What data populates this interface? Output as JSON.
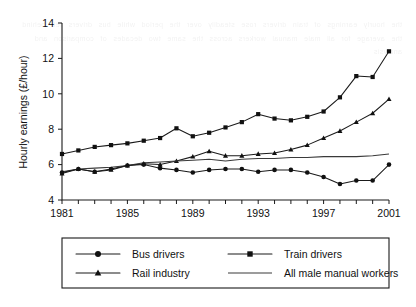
{
  "chart_data": {
    "type": "line",
    "title": "",
    "xlabel": "",
    "ylabel": "Hourly earnings (£/hour)",
    "xlim": [
      1981,
      2001
    ],
    "ylim": [
      4,
      14
    ],
    "yticks": [
      4,
      6,
      8,
      10,
      12,
      14
    ],
    "xticks": [
      1981,
      1982,
      1983,
      1984,
      1985,
      1986,
      1987,
      1988,
      1989,
      1990,
      1991,
      1992,
      1993,
      1994,
      1995,
      1996,
      1997,
      1998,
      1999,
      2000,
      2001
    ],
    "xtick_labels": [
      "1981",
      "",
      "",
      "",
      "1985",
      "",
      "",
      "",
      "1989",
      "",
      "",
      "",
      "1993",
      "",
      "",
      "",
      "1997",
      "",
      "",
      "",
      "2001"
    ],
    "grid": false,
    "legend_position": "below",
    "x": [
      1981,
      1982,
      1983,
      1984,
      1985,
      1986,
      1987,
      1988,
      1989,
      1990,
      1991,
      1992,
      1993,
      1994,
      1995,
      1996,
      1997,
      1998,
      1999,
      2000,
      2001
    ],
    "series": [
      {
        "name": "Train drivers",
        "marker": "square",
        "values": [
          6.6,
          6.8,
          7.0,
          7.1,
          7.2,
          7.35,
          7.5,
          8.05,
          7.6,
          7.8,
          8.1,
          8.4,
          8.85,
          8.6,
          8.5,
          8.7,
          9.0,
          9.8,
          11.0,
          10.95,
          12.4
        ]
      },
      {
        "name": "Rail industry",
        "marker": "triangle",
        "values": [
          5.5,
          5.75,
          5.6,
          5.7,
          5.95,
          6.05,
          6.0,
          6.2,
          6.45,
          6.75,
          6.5,
          6.5,
          6.6,
          6.65,
          6.85,
          7.1,
          7.5,
          7.9,
          8.4,
          8.9,
          9.7
        ]
      },
      {
        "name": "All male manual workers",
        "marker": "none",
        "values": [
          5.6,
          5.75,
          5.8,
          5.85,
          5.95,
          6.1,
          6.15,
          6.2,
          6.25,
          6.3,
          6.2,
          6.3,
          6.35,
          6.35,
          6.4,
          6.4,
          6.45,
          6.45,
          6.45,
          6.5,
          6.6
        ]
      },
      {
        "name": "Bus drivers",
        "marker": "circle",
        "values": [
          5.55,
          5.75,
          5.6,
          5.75,
          5.95,
          6.0,
          5.8,
          5.7,
          5.55,
          5.7,
          5.75,
          5.75,
          5.6,
          5.7,
          5.7,
          5.55,
          5.3,
          4.9,
          5.1,
          5.1,
          6.0
        ]
      }
    ]
  },
  "legend": {
    "entries": [
      {
        "label": "Bus drivers",
        "marker": "circle"
      },
      {
        "label": "Train drivers",
        "marker": "square"
      },
      {
        "label": "Rail industry",
        "marker": "triangle"
      },
      {
        "label": "All male manual workers",
        "marker": "none"
      }
    ]
  },
  "colors": {
    "ink": "#1a1a1a",
    "line": "#111111",
    "plain_line": "#3a3a3a",
    "background": "#ffffff"
  },
  "background_bleed_text": "the hourly earnings of train drivers rose steadily over the period while bus drivers fell behind the average for all male manual workers across the same two decades of comparison and analysis"
}
